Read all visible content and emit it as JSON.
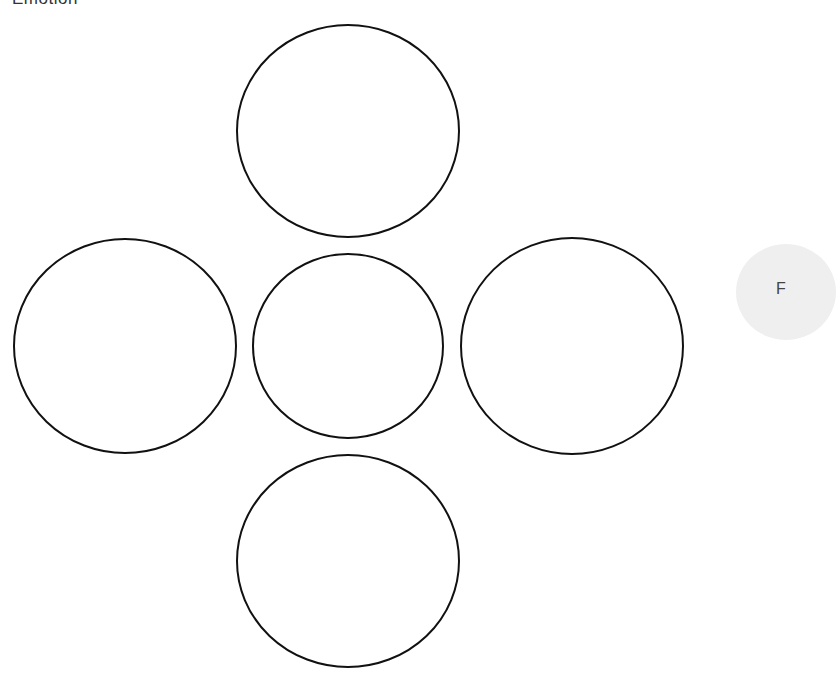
{
  "header": {
    "title": "Emotion"
  },
  "diagram": {
    "stroke_color": "#111111",
    "fill_color": "#ffffff",
    "circles": [
      {
        "name": "top",
        "cx": 348,
        "cy": 131,
        "rx": 111,
        "ry": 106,
        "label": ""
      },
      {
        "name": "left",
        "cx": 125,
        "cy": 346,
        "rx": 111,
        "ry": 107,
        "label": ""
      },
      {
        "name": "center",
        "cx": 348,
        "cy": 346,
        "rx": 95,
        "ry": 92,
        "label": ""
      },
      {
        "name": "right",
        "cx": 572,
        "cy": 346,
        "rx": 111,
        "ry": 108,
        "label": ""
      },
      {
        "name": "bottom",
        "cx": 348,
        "cy": 561,
        "rx": 111,
        "ry": 106,
        "label": ""
      }
    ]
  },
  "side_bubble": {
    "label": "F",
    "color": "#efefef"
  }
}
